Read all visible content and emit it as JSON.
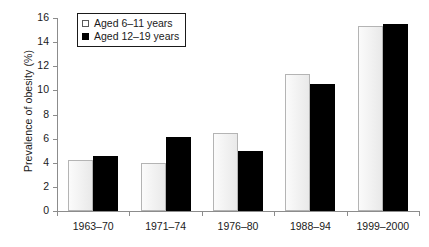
{
  "chart_data": {
    "type": "bar",
    "title": "",
    "xlabel": "",
    "ylabel": "Prevalence of obesity (%)",
    "ylim": [
      0,
      16
    ],
    "yticks": [
      0,
      2,
      4,
      6,
      8,
      10,
      12,
      14,
      16
    ],
    "grid": false,
    "legend_position": "top-left",
    "categories": [
      "1963–70",
      "1971–74",
      "1976–80",
      "1988–94",
      "1999–2000"
    ],
    "series": [
      {
        "name": "Aged 6–11 years",
        "color": "#f2f2f2",
        "edge_color": "#b4b4b4",
        "values": [
          4.2,
          4.0,
          6.5,
          11.4,
          15.3
        ]
      },
      {
        "name": "Aged 12–19 years",
        "color": "#000000",
        "edge_color": "#000000",
        "values": [
          4.6,
          6.1,
          5.0,
          10.5,
          15.5
        ]
      }
    ]
  },
  "legend": {
    "items": [
      {
        "label": "Aged 6–11 years",
        "swatch": "light-square-icon"
      },
      {
        "label": "Aged 12–19 years",
        "swatch": "black-square-icon"
      }
    ]
  },
  "axis": {
    "y_title": "Prevalence of obesity (%)",
    "y_tick_labels": [
      "0",
      "2",
      "4",
      "6",
      "8",
      "10",
      "12",
      "14",
      "16"
    ],
    "x_tick_labels": [
      "1963–70",
      "1971–74",
      "1976–80",
      "1988–94",
      "1999–2000"
    ]
  }
}
